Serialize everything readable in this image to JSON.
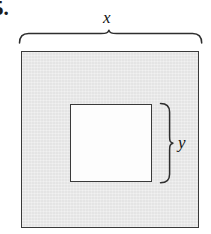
{
  "figure": {
    "problem_number": "5.",
    "outer_shape": {
      "name": "outer-square",
      "fill_color": "#e9e9e9",
      "stroke_color": "#3a3a3a",
      "side_label": "x"
    },
    "inner_shape": {
      "name": "inner-square",
      "fill_color": "#fdfdfd",
      "stroke_color": "#3a3a3a",
      "side_label": "y"
    },
    "dimensions": [
      {
        "id": "x",
        "label": "x",
        "orientation": "horizontal",
        "position": "top",
        "measures": "outer-square-side"
      },
      {
        "id": "y",
        "label": "y",
        "orientation": "vertical",
        "position": "right",
        "measures": "inner-square-side"
      }
    ],
    "braces": {
      "top_brace_name": "x-dimension-brace",
      "right_brace_name": "y-dimension-brace",
      "stroke_color": "#2e2e2e"
    }
  }
}
